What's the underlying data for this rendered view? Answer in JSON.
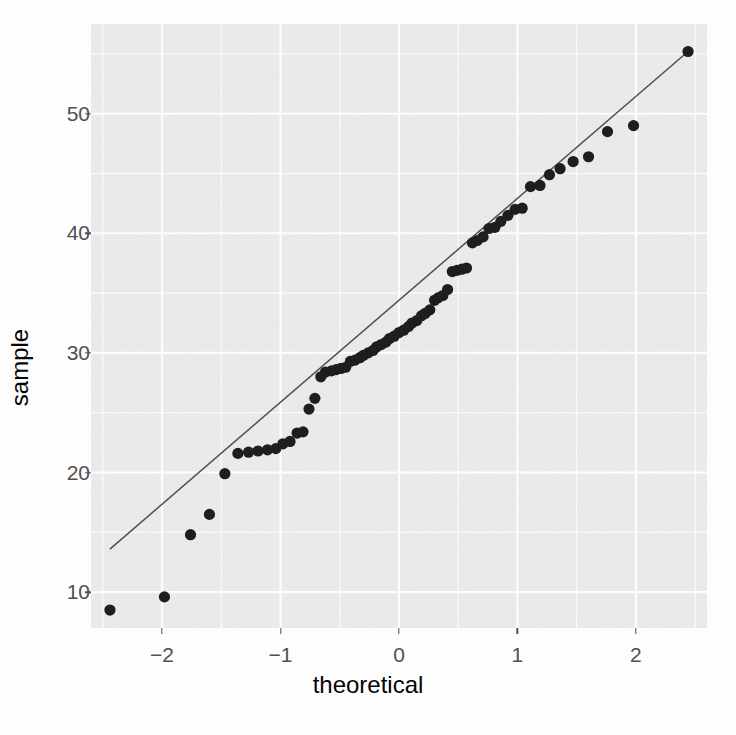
{
  "chart_data": {
    "type": "scatter",
    "title": "",
    "xlabel": "theoretical",
    "ylabel": "sample",
    "xlim": [
      -2.6,
      2.6
    ],
    "ylim": [
      7.0,
      57.5
    ],
    "grid": true,
    "legend": "none",
    "x_ticks": [
      -2,
      -1,
      0,
      1,
      2
    ],
    "x_tick_labels": [
      "−2",
      "−1",
      "0",
      "1",
      "2"
    ],
    "y_ticks": [
      10,
      20,
      30,
      40,
      50
    ],
    "y_tick_labels": [
      "10",
      "20",
      "30",
      "40",
      "50"
    ],
    "point_color": "#1a1a1a",
    "line_color": "#4d4d4d",
    "panel_background": "#ebebeb",
    "gridline_color": "#ffffff",
    "reference_line": {
      "x": [
        -2.44,
        2.44
      ],
      "y": [
        13.6,
        55.2
      ]
    },
    "points": [
      {
        "x": -2.44,
        "y": 8.5
      },
      {
        "x": -1.98,
        "y": 9.6
      },
      {
        "x": -1.76,
        "y": 14.8
      },
      {
        "x": -1.6,
        "y": 16.5
      },
      {
        "x": -1.47,
        "y": 19.9
      },
      {
        "x": -1.36,
        "y": 21.6
      },
      {
        "x": -1.27,
        "y": 21.7
      },
      {
        "x": -1.19,
        "y": 21.8
      },
      {
        "x": -1.11,
        "y": 21.9
      },
      {
        "x": -1.04,
        "y": 22.0
      },
      {
        "x": -0.98,
        "y": 22.4
      },
      {
        "x": -0.92,
        "y": 22.6
      },
      {
        "x": -0.86,
        "y": 23.3
      },
      {
        "x": -0.81,
        "y": 23.4
      },
      {
        "x": -0.76,
        "y": 25.3
      },
      {
        "x": -0.71,
        "y": 26.2
      },
      {
        "x": -0.66,
        "y": 28.0
      },
      {
        "x": -0.62,
        "y": 28.4
      },
      {
        "x": -0.57,
        "y": 28.5
      },
      {
        "x": -0.53,
        "y": 28.6
      },
      {
        "x": -0.49,
        "y": 28.7
      },
      {
        "x": -0.45,
        "y": 28.8
      },
      {
        "x": -0.41,
        "y": 29.3
      },
      {
        "x": -0.37,
        "y": 29.4
      },
      {
        "x": -0.33,
        "y": 29.6
      },
      {
        "x": -0.3,
        "y": 29.8
      },
      {
        "x": -0.26,
        "y": 30.0
      },
      {
        "x": -0.22,
        "y": 30.2
      },
      {
        "x": -0.19,
        "y": 30.5
      },
      {
        "x": -0.15,
        "y": 30.7
      },
      {
        "x": -0.11,
        "y": 30.9
      },
      {
        "x": -0.08,
        "y": 31.2
      },
      {
        "x": -0.04,
        "y": 31.4
      },
      {
        "x": 0.0,
        "y": 31.7
      },
      {
        "x": 0.04,
        "y": 31.9
      },
      {
        "x": 0.08,
        "y": 32.2
      },
      {
        "x": 0.11,
        "y": 32.5
      },
      {
        "x": 0.15,
        "y": 32.7
      },
      {
        "x": 0.19,
        "y": 33.1
      },
      {
        "x": 0.22,
        "y": 33.3
      },
      {
        "x": 0.26,
        "y": 33.6
      },
      {
        "x": 0.3,
        "y": 34.4
      },
      {
        "x": 0.33,
        "y": 34.6
      },
      {
        "x": 0.37,
        "y": 34.8
      },
      {
        "x": 0.41,
        "y": 35.3
      },
      {
        "x": 0.45,
        "y": 36.8
      },
      {
        "x": 0.49,
        "y": 36.9
      },
      {
        "x": 0.53,
        "y": 37.0
      },
      {
        "x": 0.57,
        "y": 37.1
      },
      {
        "x": 0.62,
        "y": 39.2
      },
      {
        "x": 0.66,
        "y": 39.4
      },
      {
        "x": 0.71,
        "y": 39.7
      },
      {
        "x": 0.76,
        "y": 40.4
      },
      {
        "x": 0.81,
        "y": 40.5
      },
      {
        "x": 0.86,
        "y": 41.0
      },
      {
        "x": 0.92,
        "y": 41.5
      },
      {
        "x": 0.98,
        "y": 42.0
      },
      {
        "x": 1.04,
        "y": 42.1
      },
      {
        "x": 1.11,
        "y": 43.9
      },
      {
        "x": 1.19,
        "y": 44.0
      },
      {
        "x": 1.27,
        "y": 44.9
      },
      {
        "x": 1.36,
        "y": 45.4
      },
      {
        "x": 1.47,
        "y": 46.0
      },
      {
        "x": 1.6,
        "y": 46.4
      },
      {
        "x": 1.76,
        "y": 48.5
      },
      {
        "x": 1.98,
        "y": 49.0
      },
      {
        "x": 2.44,
        "y": 55.2
      }
    ],
    "x_minor_ticks": [
      -2.5,
      -1.5,
      -0.5,
      0.5,
      1.5,
      2.5
    ],
    "y_minor_ticks": [
      15,
      25,
      35,
      45,
      55
    ]
  }
}
